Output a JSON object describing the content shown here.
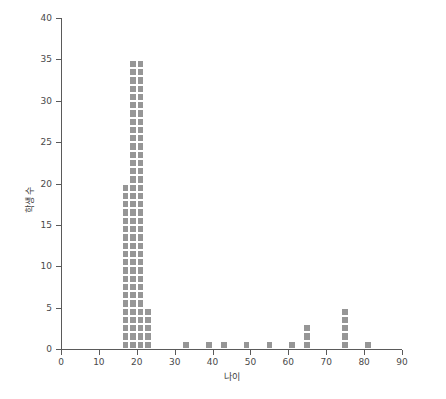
{
  "chart_data": {
    "type": "bar",
    "title": "",
    "xlabel": "나이",
    "ylabel": "학생 수",
    "xlim": [
      0,
      90
    ],
    "ylim": [
      0,
      40
    ],
    "xticks": [
      0,
      10,
      20,
      30,
      40,
      50,
      60,
      70,
      80,
      90
    ],
    "xtick_labels": [
      "0",
      "10",
      "20",
      "30",
      "40",
      "50",
      "60",
      "70",
      "80",
      "90"
    ],
    "yticks": [
      0,
      5,
      10,
      15,
      20,
      25,
      30,
      35,
      40
    ],
    "ytick_labels": [
      "0",
      "5",
      "10",
      "15",
      "20",
      "25",
      "30",
      "35",
      "40"
    ],
    "grid": false,
    "legend": null,
    "bar_color": "#969696",
    "bar_width": 2,
    "unit_marker": "square",
    "categories": [
      17,
      19,
      21,
      23,
      33,
      39,
      43,
      49,
      55,
      61,
      65,
      75,
      81
    ],
    "values": [
      20,
      35,
      35,
      5,
      1,
      1,
      1,
      1,
      1,
      1,
      3,
      5,
      1
    ],
    "points": [
      {
        "x": 17,
        "y": 20
      },
      {
        "x": 19,
        "y": 35
      },
      {
        "x": 21,
        "y": 35
      },
      {
        "x": 23,
        "y": 5
      },
      {
        "x": 33,
        "y": 1
      },
      {
        "x": 39,
        "y": 1
      },
      {
        "x": 43,
        "y": 1
      },
      {
        "x": 49,
        "y": 1
      },
      {
        "x": 55,
        "y": 1
      },
      {
        "x": 61,
        "y": 1
      },
      {
        "x": 65,
        "y": 3
      },
      {
        "x": 75,
        "y": 5
      },
      {
        "x": 81,
        "y": 1
      }
    ]
  },
  "axes": {
    "x_title": "나이",
    "y_title": "학생 수"
  }
}
